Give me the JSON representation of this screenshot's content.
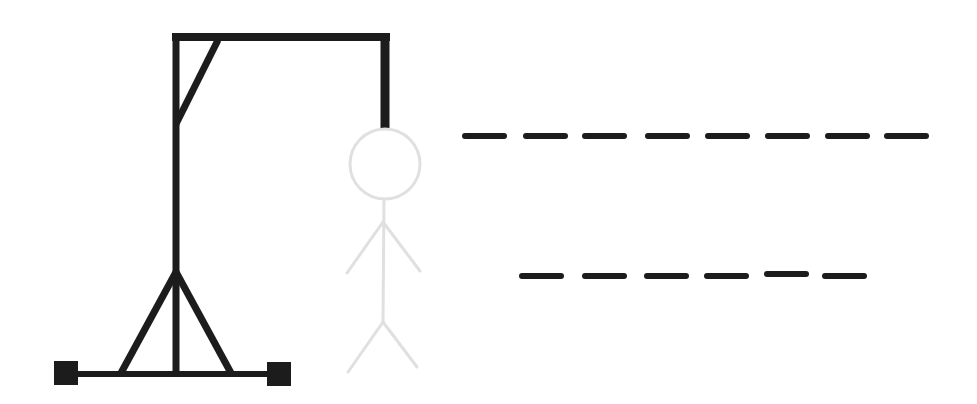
{
  "game": {
    "title": "Hangman",
    "colors": {
      "gallows": "#1c1c1c",
      "figure": "#e0e0e0",
      "blank": "#1c1c1c",
      "background": "#ffffff"
    },
    "figure_parts": [
      "head",
      "body",
      "left-arm",
      "right-arm",
      "left-leg",
      "right-leg"
    ],
    "figure_state": "unrevealed-outline",
    "words": [
      {
        "length": 8,
        "letters": [
          "",
          "",
          "",
          "",
          "",
          "",
          "",
          ""
        ]
      },
      {
        "length": 6,
        "letters": [
          "",
          "",
          "",
          "",
          "",
          ""
        ]
      }
    ]
  }
}
